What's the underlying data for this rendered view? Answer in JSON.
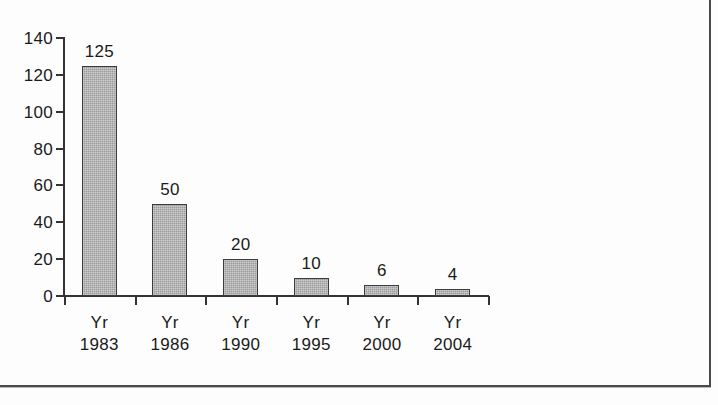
{
  "figure": {
    "background_color": "#fdfdfd",
    "frame_color": "#4a4a4a",
    "axis_color": "#333333",
    "bar_fill_color": "#9b9b9b",
    "bar_border_color": "#3c3c3c",
    "text_color": "#1a1a1a"
  },
  "chart_data": {
    "type": "bar",
    "title": "",
    "subtitle": "",
    "xlabel": "",
    "ylabel": "",
    "categories": [
      "Yr 1983",
      "Yr 1986",
      "Yr 1990",
      "Yr 1995",
      "Yr 2000",
      "Yr 2004"
    ],
    "category_lines": [
      [
        "Yr",
        "1983"
      ],
      [
        "Yr",
        "1986"
      ],
      [
        "Yr",
        "1990"
      ],
      [
        "Yr",
        "1995"
      ],
      [
        "Yr",
        "2000"
      ],
      [
        "Yr",
        "2004"
      ]
    ],
    "values": [
      125,
      50,
      20,
      10,
      6,
      4
    ],
    "data_labels": [
      "125",
      "50",
      "20",
      "10",
      "6",
      "4"
    ],
    "ylim": [
      0,
      140
    ],
    "ytick_values": [
      0,
      20,
      40,
      60,
      80,
      100,
      120,
      140
    ],
    "ytick_labels": [
      "0",
      "20",
      "40",
      "60",
      "80",
      "100",
      "120",
      "140"
    ],
    "grid": false,
    "legend": null,
    "legend_position": "none",
    "annotations": []
  }
}
